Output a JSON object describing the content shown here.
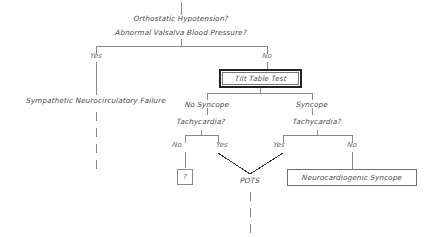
{
  "diagram": {
    "background_color": "#ffffff",
    "line_color": "#8a8a8a",
    "emphasis_border_color": "#222222",
    "text_color": "#4a4a4a"
  },
  "nodes": {
    "root_question_line1": "Orthostatic Hypotension?",
    "root_question_line2": "Abnormal Valsalva Blood Pressure?",
    "sympathetic_failure": "Sympathetic Neurocirculatory Failure",
    "tilt_table_test": "Tilt Table Test",
    "no_syncope": "No Syncope",
    "syncope": "Syncope",
    "tachycardia_left": "Tachycardia?",
    "tachycardia_right": "Tachycardia?",
    "unknown_outcome": "?",
    "pots": "POTS",
    "neurocardiogenic_syncope": "Neurocardiogenic Syncope"
  },
  "edge_labels": {
    "root_yes": "Yes",
    "root_no": "No",
    "tachy_left_no": "No",
    "tachy_left_yes": "Yes",
    "tachy_right_yes": "Yes",
    "tachy_right_no": "No"
  }
}
